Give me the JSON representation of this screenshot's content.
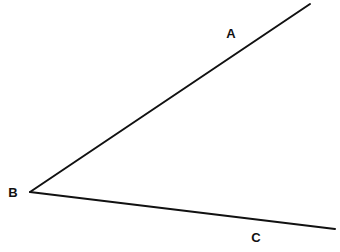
{
  "diagram": {
    "type": "angle",
    "stroke_color": "#111111",
    "background_color": "#ffffff",
    "vertex": {
      "label": "B",
      "x": 30,
      "y": 192,
      "label_x": 13,
      "label_y": 197
    },
    "rays": [
      {
        "name": "BA",
        "end_label": "A",
        "x1": 30,
        "y1": 192,
        "x2": 310,
        "y2": 4,
        "label_x": 231,
        "label_y": 38
      },
      {
        "name": "BC",
        "end_label": "C",
        "x1": 30,
        "y1": 192,
        "x2": 335,
        "y2": 229,
        "label_x": 256,
        "label_y": 242
      }
    ]
  }
}
